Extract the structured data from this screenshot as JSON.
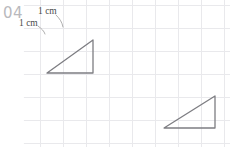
{
  "page": {
    "width": 230,
    "height": 147,
    "background": "#ffffff",
    "problem_number": "04"
  },
  "grid": {
    "cell_size": 23,
    "origin_x": 40,
    "origin_y": 5,
    "columns": 9,
    "rows": 7,
    "line_color": "#e9e9ec",
    "line_width": 1
  },
  "annotations": {
    "unit_label_top": "1 cm",
    "unit_label_left": "1 cm",
    "leader_color": "#9a9a9a"
  },
  "figures": {
    "stroke_color": "#7d7d82",
    "stroke_width": 1.3,
    "shapes": [
      {
        "name": "triangle-upper-left",
        "type": "right-triangle",
        "right_angle_at": "bottom-right",
        "base_cells": 2,
        "height_cells": 1.5,
        "points": "47,73 93,73 93,40"
      },
      {
        "name": "triangle-lower-right",
        "type": "right-triangle",
        "right_angle_at": "bottom-right",
        "base_cells": 2.2,
        "height_cells": 1.4,
        "points": "164,128 215,128 215,96"
      }
    ]
  }
}
